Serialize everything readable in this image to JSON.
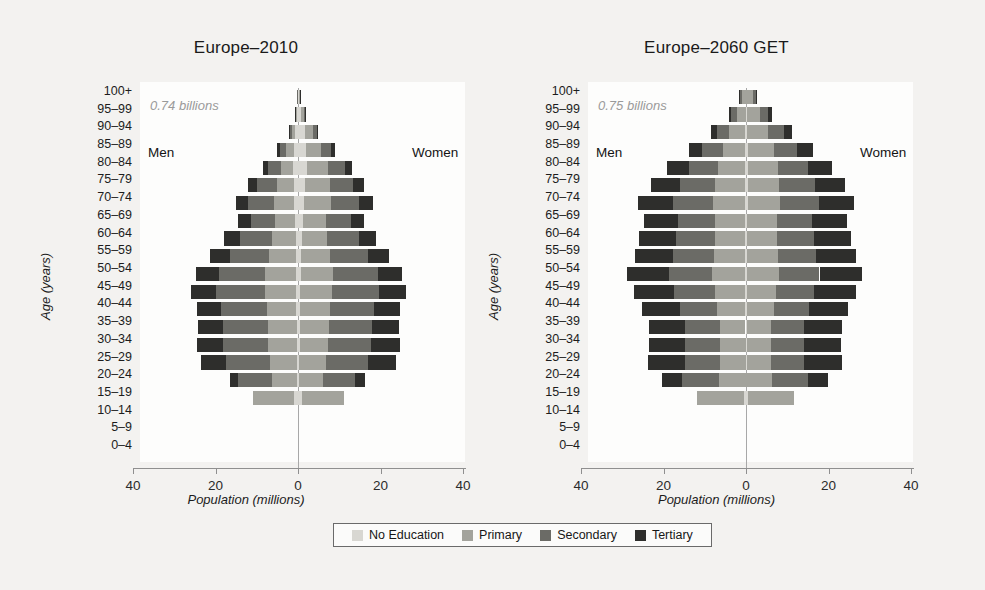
{
  "figure": {
    "background_color": "#f3f2f0",
    "plot_background_color": "#fdfdfc"
  },
  "legend": {
    "position": "bottom-center",
    "items": [
      {
        "label": "No Education",
        "color": "#d8d7d2"
      },
      {
        "label": "Primary",
        "color": "#a3a39c"
      },
      {
        "label": "Secondary",
        "color": "#6b6b66"
      },
      {
        "label": "Tertiary",
        "color": "#2e2e2c"
      }
    ]
  },
  "panels": [
    {
      "title": "Europe–2010",
      "total_label": "0.74 billions",
      "men_label": "Men",
      "women_label": "Women",
      "xlabel": "Population (millions)",
      "ylabel": "Age (years)"
    },
    {
      "title": "Europe–2060 GET",
      "total_label": "0.75 billions",
      "men_label": "Men",
      "women_label": "Women",
      "xlabel": "Population (millions)",
      "ylabel": "Age (years)"
    }
  ],
  "axis": {
    "x_ticks": [
      "40",
      "20",
      "0",
      "20",
      "40"
    ],
    "x_tick_values": [
      -40,
      -20,
      0,
      20,
      40
    ],
    "xlim": [
      -40,
      40
    ],
    "age_groups": [
      "100+",
      "95–99",
      "90–94",
      "85–89",
      "80–84",
      "75–79",
      "70–74",
      "65–69",
      "60–64",
      "55–59",
      "50–54",
      "45–49",
      "40–44",
      "35–39",
      "30–34",
      "25–29",
      "20–24",
      "15–19",
      "10–14",
      "5–9",
      "0–4"
    ]
  },
  "chart_data": {
    "type": "bar",
    "subtype": "population-pyramid-stacked",
    "xlabel": "Population (millions)",
    "ylabel": "Age (years)",
    "xlim": [
      -40,
      40
    ],
    "x_ticks": [
      -40,
      -20,
      0,
      20,
      40
    ],
    "x_tick_labels": [
      "40",
      "20",
      "0",
      "20",
      "40"
    ],
    "grid": false,
    "legend": [
      "No Education",
      "Primary",
      "Secondary",
      "Tertiary"
    ],
    "legend_position": "bottom-center",
    "categories": [
      "100+",
      "95–99",
      "90–94",
      "85–89",
      "80–84",
      "75–79",
      "70–74",
      "65–69",
      "60–64",
      "55–59",
      "50–54",
      "45–49",
      "40–44",
      "35–39",
      "30–34",
      "25–29",
      "20–24",
      "15–19",
      "10–14",
      "5–9",
      "0–4"
    ],
    "panels": [
      {
        "name": "Europe–2010",
        "total_population_billions": 0.74,
        "note": "values are millions per 5-year age group; men plotted left of zero, women right",
        "men": {
          "no_education": [
            0.1,
            0.3,
            0.7,
            1.0,
            1.1,
            1.0,
            0.9,
            0.7,
            0.6,
            0.55,
            0.5,
            0.45,
            0.4,
            0.35,
            0.3,
            0.28,
            0.25,
            0.9,
            0,
            0,
            0
          ],
          "primary": [
            0.05,
            0.25,
            0.8,
            1.8,
            3.0,
            4.2,
            5.0,
            4.8,
            5.6,
            6.5,
            7.5,
            7.6,
            7.2,
            7.0,
            6.9,
            6.6,
            6.0,
            10.0,
            0,
            0,
            0
          ],
          "secondary": [
            0.02,
            0.15,
            0.6,
            1.6,
            3.1,
            4.8,
            6.2,
            6.0,
            7.8,
            9.5,
            11.2,
            11.8,
            11.0,
            10.8,
            11.0,
            10.6,
            8.3,
            0,
            0,
            0,
            0
          ],
          "tertiary": [
            0.01,
            0.05,
            0.2,
            0.7,
            1.4,
            2.2,
            3.0,
            3.0,
            3.9,
            4.8,
            5.6,
            6.0,
            5.9,
            6.2,
            6.3,
            6.0,
            2.0,
            0,
            0,
            0,
            0
          ]
        },
        "women": {
          "no_education": [
            0.3,
            0.8,
            1.6,
            2.0,
            2.1,
            1.8,
            1.5,
            1.1,
            0.9,
            0.8,
            0.7,
            0.6,
            0.5,
            0.45,
            0.4,
            0.35,
            0.3,
            0.95,
            0,
            0,
            0
          ],
          "primary": [
            0.15,
            0.7,
            2.0,
            3.6,
            5.2,
            6.0,
            6.5,
            5.6,
            6.2,
            7.0,
            7.8,
            7.7,
            7.2,
            7.0,
            6.8,
            6.4,
            5.7,
            10.1,
            0,
            0,
            0
          ],
          "secondary": [
            0.05,
            0.3,
            1.0,
            2.4,
            4.2,
            5.6,
            6.8,
            6.1,
            7.6,
            9.2,
            10.8,
            11.3,
            10.7,
            10.4,
            10.6,
            10.2,
            7.9,
            0,
            0,
            0,
            0
          ],
          "tertiary": [
            0.02,
            0.08,
            0.3,
            0.9,
            1.7,
            2.5,
            3.3,
            3.1,
            4.1,
            5.0,
            6.0,
            6.5,
            6.4,
            6.7,
            6.9,
            6.7,
            2.3,
            0,
            0,
            0,
            0
          ]
        }
      },
      {
        "name": "Europe–2060 GET",
        "total_population_billions": 0.75,
        "note": "values are millions per 5-year age group; men plotted left of zero, women right",
        "men": {
          "no_education": [
            0.05,
            0.1,
            0.2,
            0.25,
            0.3,
            0.3,
            0.3,
            0.25,
            0.22,
            0.2,
            0.18,
            0.16,
            0.14,
            0.12,
            0.1,
            0.1,
            0.1,
            0.4,
            0,
            0,
            0
          ],
          "primary": [
            1.0,
            2.1,
            3.8,
            5.4,
            6.6,
            7.2,
            7.8,
            7.2,
            7.4,
            7.6,
            8.0,
            7.4,
            6.8,
            6.3,
            6.2,
            6.2,
            6.5,
            11.6,
            0,
            0,
            0
          ],
          "secondary": [
            0.55,
            1.4,
            3.0,
            5.0,
            7.0,
            8.6,
            9.6,
            9.0,
            9.4,
            9.8,
            10.4,
            9.8,
            9.0,
            8.4,
            8.4,
            8.5,
            9.0,
            0,
            0,
            0,
            0
          ],
          "tertiary": [
            0.1,
            0.6,
            1.6,
            3.2,
            5.2,
            7.0,
            8.4,
            8.2,
            8.8,
            9.4,
            10.2,
            9.8,
            9.2,
            8.8,
            8.9,
            9.0,
            4.8,
            0,
            0,
            0,
            0
          ]
        },
        "women": {
          "no_education": [
            0.1,
            0.2,
            0.35,
            0.4,
            0.45,
            0.42,
            0.38,
            0.32,
            0.28,
            0.25,
            0.22,
            0.2,
            0.18,
            0.16,
            0.14,
            0.13,
            0.12,
            0.42,
            0,
            0,
            0
          ],
          "primary": [
            1.6,
            3.1,
            5.0,
            6.4,
            7.4,
            7.6,
            7.9,
            7.1,
            7.2,
            7.4,
            7.7,
            7.1,
            6.5,
            6.0,
            5.9,
            5.9,
            6.2,
            11.1,
            0,
            0,
            0
          ],
          "secondary": [
            0.8,
            2.0,
            3.8,
            5.6,
            7.3,
            8.6,
            9.3,
            8.6,
            8.9,
            9.3,
            9.9,
            9.3,
            8.6,
            8.0,
            8.0,
            8.1,
            8.6,
            0,
            0,
            0,
            0
          ],
          "tertiary": [
            0.2,
            0.9,
            2.1,
            3.8,
            5.8,
            7.4,
            8.7,
            8.4,
            9.0,
            9.6,
            10.4,
            10.0,
            9.4,
            9.0,
            9.1,
            9.2,
            5.0,
            0,
            0,
            0,
            0
          ]
        }
      }
    ]
  }
}
